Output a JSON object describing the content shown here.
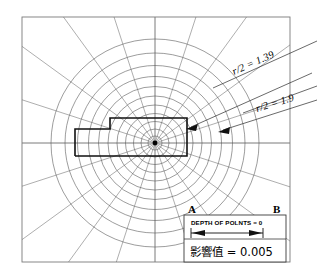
{
  "figure": {
    "type": "polar-influence-chart"
  },
  "annotations": {
    "radius_label_outer": "r/2 = 1.39",
    "radius_label_inner": "r/2 = 1.9",
    "point_a": "A",
    "point_b": "B"
  },
  "legend": {
    "depth_label": "DEPTH OF POLNTS = 0",
    "influence_label": "影響值 = 0.005"
  },
  "chart_data": {
    "type": "polar-grid",
    "center": {
      "x": 155,
      "y": 143
    },
    "influence_value": 0.005,
    "depth_of_points": 0,
    "radial_sectors": 20,
    "ring_count": 11,
    "ring_radii_px": [
      7,
      14,
      21.5,
      29.5,
      38,
      47,
      56.5,
      66.5,
      77.5,
      90,
      104
    ],
    "radius_labels": [
      {
        "text": "r/2 = 1.39",
        "ring_index": 10
      },
      {
        "text": "r/2 = 1.9",
        "ring_index": 9
      }
    ],
    "frame": {
      "x": 22,
      "y": 17,
      "width": 268,
      "height": 245
    },
    "footprint_polygon_px": [
      [
        75,
        156
      ],
      [
        75,
        129
      ],
      [
        110,
        129
      ],
      [
        110,
        118
      ],
      [
        187,
        118
      ],
      [
        187,
        156
      ],
      [
        75,
        156
      ]
    ],
    "xlabel": "",
    "ylabel": "",
    "grid": true,
    "legend_position": "bottom-right"
  }
}
